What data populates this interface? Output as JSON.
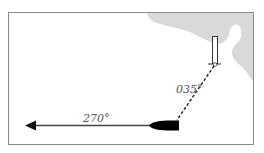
{
  "diagram": {
    "bearings": {
      "course": "270°",
      "transit": "035°"
    },
    "colors": {
      "land": "#d9d9d9",
      "frame": "#8a8a8a",
      "vessel": "#000000",
      "line": "#444444"
    }
  }
}
